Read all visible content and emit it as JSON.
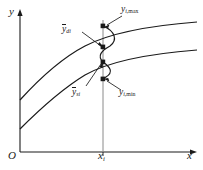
{
  "figure": {
    "type": "engineering-scatter-band-diagram",
    "background": "#ffffff",
    "line_color": "#1a1a1a",
    "axes": {
      "y_label": "y",
      "x_label": "x",
      "origin_label": "O",
      "x_tick_label_base": "x",
      "x_tick_label_sub": "i"
    },
    "labels": {
      "y_max": {
        "base": "y",
        "sub": "i,",
        "sub2": "max",
        "full": "y i,max"
      },
      "y_min": {
        "base": "y",
        "sub": "i,",
        "sub2": "min",
        "full": "y i,min"
      },
      "y_d_mean": {
        "base": "y",
        "sub": "di",
        "full": "y di (overbar)"
      },
      "y_s_mean": {
        "base": "y",
        "sub": "si",
        "full": "y si (overbar)"
      }
    },
    "points": [
      {
        "name": "y-i-max-point",
        "x": 103,
        "y": 26
      },
      {
        "name": "y-di-point",
        "x": 103,
        "y": 47
      },
      {
        "name": "y-si-point",
        "x": 103,
        "y": 62
      },
      {
        "name": "y-i-min-point",
        "x": 103,
        "y": 79
      }
    ],
    "curves": {
      "upper_curve_name": "upper-trend-curve",
      "lower_curve_name": "lower-trend-curve",
      "distribution_name": "distribution-wave-curve",
      "vertical_name": "vertical-ordinate-line"
    }
  }
}
